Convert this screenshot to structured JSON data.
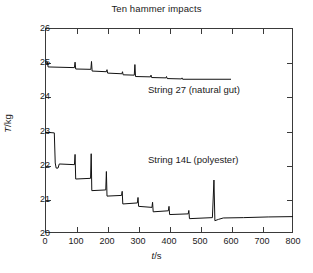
{
  "chart_data": {
    "type": "line",
    "title": "Ten hammer impacts",
    "xlabel": "t/s",
    "ylabel": "T/kg",
    "xlim": [
      0,
      800
    ],
    "ylim": [
      20,
      26
    ],
    "xticks": [
      0,
      100,
      200,
      300,
      400,
      500,
      600,
      700,
      800
    ],
    "yticks": [
      20,
      21,
      22,
      23,
      24,
      25,
      26
    ],
    "xtick_labels": [
      "0",
      "100",
      "200",
      "300",
      "400",
      "500",
      "600",
      "700",
      "800"
    ],
    "ytick_labels": [
      "20",
      "21",
      "22",
      "23",
      "24",
      "25",
      "26"
    ],
    "grid": false,
    "legend": "inline-annotations",
    "series": [
      {
        "name": "String 27 (natural gut)",
        "annotation": "String 27 (natural gut)",
        "color": "#111111",
        "points": [
          [
            0,
            25.0
          ],
          [
            8,
            25.0
          ],
          [
            10,
            24.86
          ],
          [
            95,
            24.84
          ],
          [
            97,
            25.0
          ],
          [
            99,
            24.8
          ],
          [
            148,
            24.79
          ],
          [
            150,
            25.02
          ],
          [
            152,
            24.74
          ],
          [
            198,
            24.72
          ],
          [
            200,
            24.78
          ],
          [
            202,
            24.68
          ],
          [
            248,
            24.66
          ],
          [
            250,
            24.72
          ],
          [
            252,
            24.63
          ],
          [
            288,
            24.62
          ],
          [
            290,
            24.93
          ],
          [
            292,
            24.58
          ],
          [
            340,
            24.57
          ],
          [
            342,
            24.62
          ],
          [
            344,
            24.55
          ],
          [
            390,
            24.54
          ],
          [
            392,
            24.58
          ],
          [
            394,
            24.52
          ],
          [
            440,
            24.51
          ],
          [
            442,
            24.54
          ],
          [
            444,
            24.5
          ],
          [
            600,
            24.5
          ]
        ]
      },
      {
        "name": "String 14L (polyester)",
        "annotation": "String 14L (polyester)",
        "color": "#111111",
        "points": [
          [
            0,
            22.95
          ],
          [
            30,
            22.93
          ],
          [
            33,
            22.05
          ],
          [
            36,
            21.9
          ],
          [
            42,
            21.9
          ],
          [
            46,
            22.02
          ],
          [
            95,
            22.0
          ],
          [
            97,
            22.3
          ],
          [
            99,
            21.58
          ],
          [
            147,
            21.6
          ],
          [
            149,
            22.32
          ],
          [
            151,
            21.24
          ],
          [
            196,
            21.26
          ],
          [
            198,
            21.8
          ],
          [
            200,
            21.08
          ],
          [
            247,
            21.1
          ],
          [
            249,
            21.22
          ],
          [
            251,
            20.85
          ],
          [
            298,
            20.88
          ],
          [
            300,
            21.04
          ],
          [
            302,
            20.78
          ],
          [
            345,
            20.75
          ],
          [
            347,
            20.9
          ],
          [
            349,
            20.62
          ],
          [
            398,
            20.65
          ],
          [
            400,
            20.78
          ],
          [
            402,
            20.54
          ],
          [
            462,
            20.56
          ],
          [
            464,
            20.66
          ],
          [
            466,
            20.42
          ],
          [
            540,
            20.45
          ],
          [
            545,
            21.55
          ],
          [
            548,
            20.36
          ],
          [
            560,
            20.4
          ],
          [
            575,
            20.44
          ],
          [
            640,
            20.45
          ],
          [
            720,
            20.47
          ],
          [
            800,
            20.48
          ]
        ]
      }
    ]
  },
  "axis": {
    "title": "Ten hammer impacts",
    "x_title_italic": "t",
    "x_title_rest": "/s",
    "y_title_italic": "T",
    "y_title_rest": "/kg"
  },
  "annotations": {
    "upper": "String 27 (natural gut)",
    "lower": "String 14L (polyester)"
  }
}
